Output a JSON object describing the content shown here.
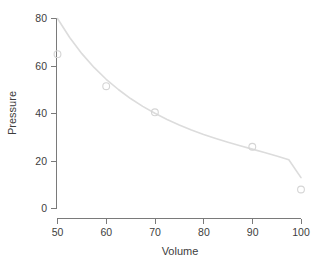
{
  "chart_data": {
    "type": "scatter",
    "title": "",
    "subtitle": "",
    "xlabel": "Volume",
    "ylabel": "Pressure",
    "xlim": [
      50,
      100
    ],
    "ylim": [
      0,
      80
    ],
    "xticks": [
      50,
      60,
      70,
      80,
      90,
      100
    ],
    "yticks": [
      0,
      20,
      40,
      60,
      80
    ],
    "xtick_labels": [
      "50",
      "60",
      "70",
      "80",
      "90",
      "100"
    ],
    "ytick_labels": [
      "0",
      "20",
      "40",
      "60",
      "80"
    ],
    "grid": false,
    "legend": null,
    "legend_position": "none",
    "annotations": [],
    "series": [
      {
        "name": "observed",
        "type": "scatter",
        "marker": "open-circle",
        "color": "#d5d5d5",
        "x": [
          50,
          60,
          70,
          90,
          100
        ],
        "y": [
          65,
          51.5,
          40.5,
          26,
          8
        ]
      },
      {
        "name": "fitted curve",
        "type": "line",
        "color": "#dcdcdc",
        "x": [
          50,
          52.5,
          55,
          57.5,
          60,
          62.5,
          65,
          67.5,
          70,
          72.5,
          75,
          77.5,
          80,
          82.5,
          85,
          87.5,
          90,
          92.5,
          95,
          97.5,
          100
        ],
        "y": [
          80.0,
          72.0,
          65.2,
          59.4,
          54.4,
          50.1,
          46.3,
          43.0,
          40.1,
          37.5,
          35.2,
          33.1,
          31.2,
          29.5,
          27.9,
          26.4,
          25.0,
          23.6,
          22.1,
          20.5,
          13.0
        ]
      }
    ]
  },
  "axis": {
    "x_title": "Volume",
    "y_title": "Pressure"
  },
  "colors": {
    "marker": "#d5d5d5",
    "curve": "#dcdcdc",
    "axis": "#7a7a7a",
    "text": "#3d3d3d",
    "background": "#ffffff"
  }
}
